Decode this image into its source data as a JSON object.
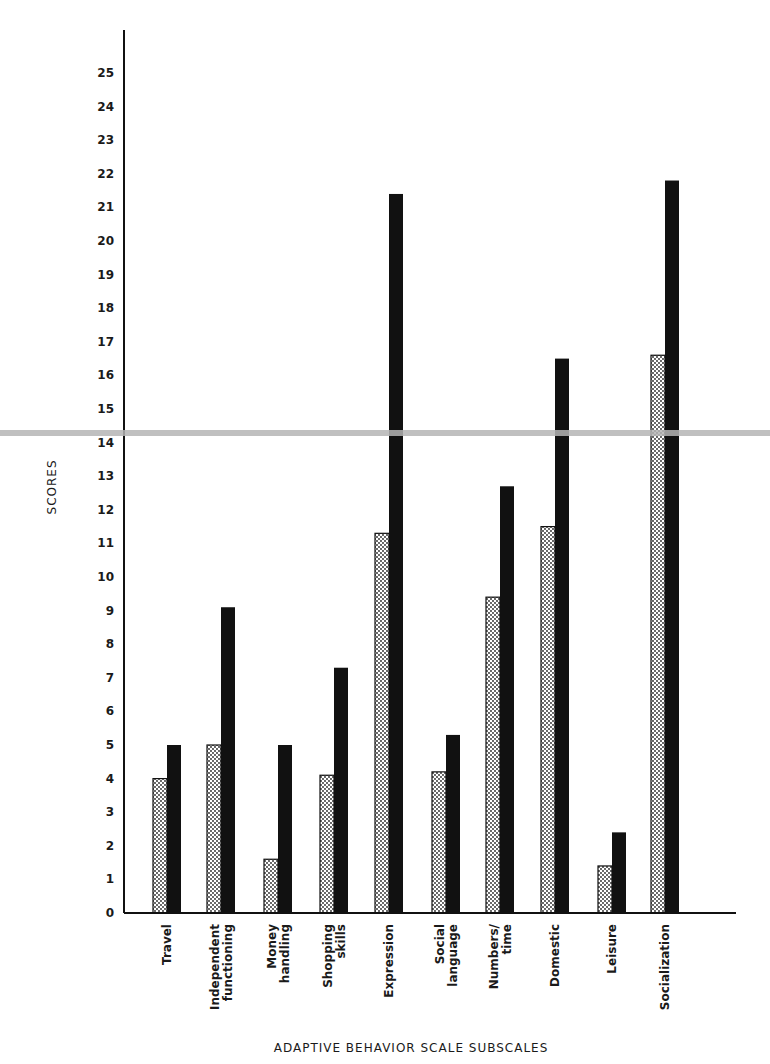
{
  "chart_data": {
    "type": "bar",
    "title": "",
    "xlabel": "ADAPTIVE BEHAVIOR SCALE SUBSCALES",
    "ylabel": "SCORES",
    "ylim": [
      0,
      25
    ],
    "yticks": [
      0,
      1,
      2,
      3,
      4,
      5,
      6,
      7,
      8,
      9,
      10,
      11,
      12,
      13,
      14,
      15,
      16,
      17,
      18,
      19,
      20,
      21,
      22,
      23,
      24,
      25
    ],
    "grid": false,
    "legend": "none",
    "categories": [
      "Travel",
      "Independent functioning",
      "Money handling",
      "Shopping skills",
      "Expression",
      "Social language",
      "Numbers/ time",
      "Domestic",
      "Leisure",
      "Socialization"
    ],
    "category_lines": [
      [
        "Travel"
      ],
      [
        "Independent",
        "functioning"
      ],
      [
        "Money",
        "handling"
      ],
      [
        "Shopping",
        "skills"
      ],
      [
        "Expression"
      ],
      [
        "Social",
        "language"
      ],
      [
        "Numbers/",
        "time"
      ],
      [
        "Domestic"
      ],
      [
        "Leisure"
      ],
      [
        "Socialization"
      ]
    ],
    "series": [
      {
        "name": "Series 1 (dotted)",
        "pattern": "dotted",
        "values": [
          4.0,
          5.0,
          1.6,
          4.1,
          11.3,
          4.2,
          9.4,
          11.5,
          1.4,
          16.6
        ]
      },
      {
        "name": "Series 2 (solid black)",
        "pattern": "solid",
        "values": [
          5.0,
          9.1,
          5.0,
          7.3,
          21.4,
          5.3,
          12.7,
          16.5,
          2.4,
          21.8
        ]
      }
    ],
    "colors": {
      "solid": "#111111",
      "dotted_fill": "#ffffff",
      "dot": "#222222",
      "axis": "#111111"
    }
  }
}
